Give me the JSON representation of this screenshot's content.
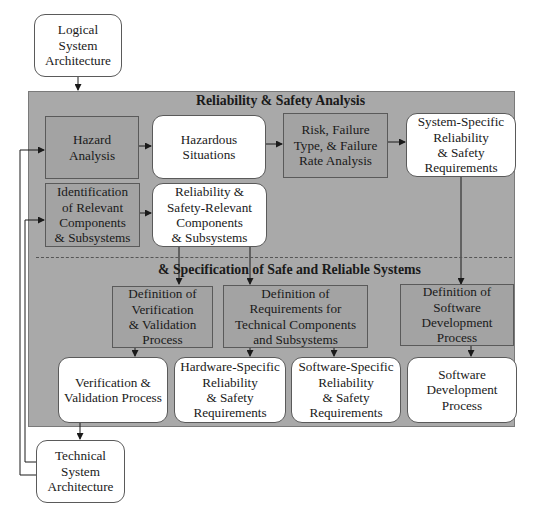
{
  "diagram": {
    "external": {
      "logical_system_architecture": "Logical\nSystem\nArchitecture",
      "technical_system_architecture": "Technical\nSystem\nArchitecture"
    },
    "panel": {
      "title_top": "Reliability & Safety Analysis",
      "title_bottom": "& Specification of Safe and Reliable Systems"
    },
    "nodes": {
      "hazard_analysis": "Hazard\nAnalysis",
      "hazardous_situations": "Hazardous\nSituations",
      "risk_failure": "Risk, Failure\nType, & Failure\nRate Analysis",
      "system_specific_requirements": "System-Specific\nReliability\n& Safety\nRequirements",
      "identification_components": "Identification\nof Relevant\nComponents\n& Subsystems",
      "relevant_components": "Reliability &\nSafety-Relevant\nComponents\n& Subsystems",
      "def_vv": "Definition of\nVerification\n& Validation\nProcess",
      "def_requirements": "Definition of\nRequirements for\nTechnical Components\nand Subsystems",
      "def_software": "Definition of\nSoftware\nDevelopment\nProcess",
      "vv_process": "Verification &\nValidation Process",
      "hardware_requirements": "Hardware-Specific\nReliability\n& Safety\nRequirements",
      "software_requirements": "Software-Specific\nReliability\n& Safety\nRequirements",
      "software_process": "Software\nDevelopment\nProcess"
    },
    "edges": [
      [
        "Logical System Architecture",
        "Reliability & Safety Analysis"
      ],
      [
        "Technical System Architecture",
        "Hazard Analysis"
      ],
      [
        "Technical System Architecture",
        "Identification of Relevant Components & Subsystems"
      ],
      [
        "Hazard Analysis",
        "Hazardous Situations"
      ],
      [
        "Hazardous Situations",
        "Risk, Failure Type, & Failure Rate Analysis"
      ],
      [
        "Risk, Failure Type, & Failure Rate Analysis",
        "System-Specific Reliability & Safety Requirements"
      ],
      [
        "Identification of Relevant Components & Subsystems",
        "Reliability & Safety-Relevant Components & Subsystems"
      ],
      [
        "Reliability & Safety-Relevant Components & Subsystems",
        "Definition of Verification & Validation Process"
      ],
      [
        "Reliability & Safety-Relevant Components & Subsystems",
        "Definition of Requirements for Technical Components and Subsystems"
      ],
      [
        "System-Specific Reliability & Safety Requirements",
        "Definition of Software Development Process"
      ],
      [
        "Definition of Verification & Validation Process",
        "Verification & Validation Process"
      ],
      [
        "Definition of Requirements for Technical Components and Subsystems",
        "Hardware-Specific Reliability & Safety Requirements"
      ],
      [
        "Definition of Requirements for Technical Components and Subsystems",
        "Software-Specific Reliability & Safety Requirements"
      ],
      [
        "Definition of Software Development Process",
        "Software Development Process"
      ],
      [
        "Verification & Validation Process",
        "Technical System Architecture"
      ]
    ],
    "colors": {
      "panel": "#a9a9a9",
      "process_box": "#a3a3a3",
      "artifact_box": "#ffffff",
      "line": "#1a1a1a"
    }
  }
}
